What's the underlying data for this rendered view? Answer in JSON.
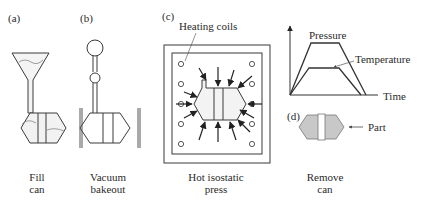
{
  "panels": {
    "a": {
      "tag": "(a)",
      "caption_line1": "Fill",
      "caption_line2": "can"
    },
    "b": {
      "tag": "(b)",
      "caption_line1": "Vacuum",
      "caption_line2": "bakeout"
    },
    "c": {
      "tag": "(c)",
      "caption_line1": "Hot isostatic",
      "caption_line2": "press",
      "callout": "Heating coils"
    },
    "d": {
      "tag": "(d)",
      "caption_line1": "Remove",
      "caption_line2": "can",
      "callout": "Part"
    }
  },
  "graph": {
    "pressure_label": "Pressure",
    "temperature_label": "Temperature",
    "time_label": "Time"
  },
  "colors": {
    "line": "#3a3a3a",
    "powder": "#e8e8e8",
    "part": "#c8c8c8"
  }
}
